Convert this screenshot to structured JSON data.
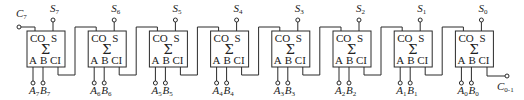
{
  "diagram": {
    "carry_in": {
      "base": "C",
      "sub": "0-1"
    },
    "carry_out": {
      "base": "C",
      "sub": "7"
    },
    "block_labels": {
      "carry_out": "CO",
      "sum": "S",
      "symbol": "Σ",
      "a": "A",
      "b": "B",
      "carry_in": "CI"
    },
    "adders": [
      {
        "bit": "7",
        "sum": {
          "base": "S",
          "sub": "7"
        },
        "a": {
          "base": "A",
          "sub": "7"
        },
        "b": {
          "base": "B",
          "sub": "7"
        }
      },
      {
        "bit": "6",
        "sum": {
          "base": "S",
          "sub": "6"
        },
        "a": {
          "base": "A",
          "sub": "6"
        },
        "b": {
          "base": "B",
          "sub": "6"
        }
      },
      {
        "bit": "5",
        "sum": {
          "base": "S",
          "sub": "5"
        },
        "a": {
          "base": "A",
          "sub": "5"
        },
        "b": {
          "base": "B",
          "sub": "5"
        }
      },
      {
        "bit": "4",
        "sum": {
          "base": "S",
          "sub": "4"
        },
        "a": {
          "base": "A",
          "sub": "4"
        },
        "b": {
          "base": "B",
          "sub": "4"
        }
      },
      {
        "bit": "3",
        "sum": {
          "base": "S",
          "sub": "3"
        },
        "a": {
          "base": "A",
          "sub": "3"
        },
        "b": {
          "base": "B",
          "sub": "3"
        }
      },
      {
        "bit": "2",
        "sum": {
          "base": "S",
          "sub": "2"
        },
        "a": {
          "base": "A",
          "sub": "2"
        },
        "b": {
          "base": "B",
          "sub": "2"
        }
      },
      {
        "bit": "1",
        "sum": {
          "base": "S",
          "sub": "1"
        },
        "a": {
          "base": "A",
          "sub": "1"
        },
        "b": {
          "base": "B",
          "sub": "1"
        }
      },
      {
        "bit": "0",
        "sum": {
          "base": "S",
          "sub": "0"
        },
        "a": {
          "base": "A",
          "sub": "0"
        },
        "b": {
          "base": "B",
          "sub": "0"
        }
      }
    ]
  }
}
